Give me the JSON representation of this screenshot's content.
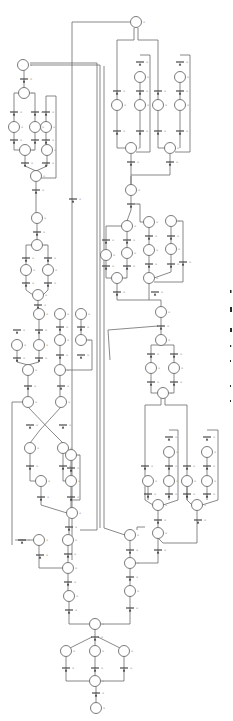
{
  "figure": {
    "kind": "petri-net",
    "colors": {
      "stroke": "#6b6b6b",
      "transition": "#3a3a3a",
      "label": "#9a9a9a",
      "background": "#ffffff"
    },
    "place_radius": 5.5,
    "places": [
      {
        "id": "p_top",
        "x": 136,
        "y": 22
      },
      {
        "id": "p_l1",
        "x": 23,
        "y": 65
      },
      {
        "id": "p_l2",
        "x": 24,
        "y": 93
      },
      {
        "id": "p_r1",
        "x": 140,
        "y": 77
      },
      {
        "id": "p_r2",
        "x": 180,
        "y": 77
      },
      {
        "id": "p_r3",
        "x": 117,
        "y": 105
      },
      {
        "id": "p_r4",
        "x": 140,
        "y": 105
      },
      {
        "id": "p_r5",
        "x": 158,
        "y": 105
      },
      {
        "id": "p_r6",
        "x": 180,
        "y": 105
      },
      {
        "id": "p_r7",
        "x": 131,
        "y": 148
      },
      {
        "id": "p_r8",
        "x": 170,
        "y": 148
      },
      {
        "id": "p_l3",
        "x": 14,
        "y": 127
      },
      {
        "id": "p_l4",
        "x": 35,
        "y": 127
      },
      {
        "id": "p_l5",
        "x": 46,
        "y": 127
      },
      {
        "id": "p_l6",
        "x": 25,
        "y": 150
      },
      {
        "id": "p_l7",
        "x": 47,
        "y": 150
      },
      {
        "id": "p_l8",
        "x": 36,
        "y": 176
      },
      {
        "id": "p_l9",
        "x": 37,
        "y": 218
      },
      {
        "id": "p_l10",
        "x": 37,
        "y": 245
      },
      {
        "id": "p_l11",
        "x": 26,
        "y": 270
      },
      {
        "id": "p_l12",
        "x": 48,
        "y": 270
      },
      {
        "id": "p_l13",
        "x": 38,
        "y": 295
      },
      {
        "id": "p_m1",
        "x": 131,
        "y": 190
      },
      {
        "id": "p_m2",
        "x": 127,
        "y": 226
      },
      {
        "id": "p_m3",
        "x": 149,
        "y": 222
      },
      {
        "id": "p_m4",
        "x": 171,
        "y": 221
      },
      {
        "id": "p_m5",
        "x": 106,
        "y": 255
      },
      {
        "id": "p_m6",
        "x": 127,
        "y": 253
      },
      {
        "id": "p_m7",
        "x": 149,
        "y": 250
      },
      {
        "id": "p_m8",
        "x": 171,
        "y": 249
      },
      {
        "id": "p_m9",
        "x": 117,
        "y": 278
      },
      {
        "id": "p_m10",
        "x": 149,
        "y": 278
      },
      {
        "id": "p_m11",
        "x": 161,
        "y": 312
      },
      {
        "id": "p_c1",
        "x": 39,
        "y": 314
      },
      {
        "id": "p_c2",
        "x": 60,
        "y": 314
      },
      {
        "id": "p_c3",
        "x": 81,
        "y": 314
      },
      {
        "id": "p_c4",
        "x": 17,
        "y": 345
      },
      {
        "id": "p_c5",
        "x": 39,
        "y": 345
      },
      {
        "id": "p_c6",
        "x": 60,
        "y": 340
      },
      {
        "id": "p_c7",
        "x": 81,
        "y": 340
      },
      {
        "id": "p_c8",
        "x": 28,
        "y": 370
      },
      {
        "id": "p_c9",
        "x": 60,
        "y": 370
      },
      {
        "id": "p_c10",
        "x": 28,
        "y": 402
      },
      {
        "id": "p_c11",
        "x": 61,
        "y": 402
      },
      {
        "id": "p_c12",
        "x": 30,
        "y": 448
      },
      {
        "id": "p_c13",
        "x": 63,
        "y": 448
      },
      {
        "id": "p_c14",
        "x": 71,
        "y": 455
      },
      {
        "id": "p_c15",
        "x": 41,
        "y": 481
      },
      {
        "id": "p_c16",
        "x": 71,
        "y": 481
      },
      {
        "id": "p_c17",
        "x": 72,
        "y": 513
      },
      {
        "id": "p_s1",
        "x": 161,
        "y": 340
      },
      {
        "id": "p_s2",
        "x": 151,
        "y": 368
      },
      {
        "id": "p_s3",
        "x": 174,
        "y": 368
      },
      {
        "id": "p_s4",
        "x": 163,
        "y": 393
      },
      {
        "id": "p_s5",
        "x": 169,
        "y": 452
      },
      {
        "id": "p_s6",
        "x": 207,
        "y": 452
      },
      {
        "id": "p_s7",
        "x": 148,
        "y": 481
      },
      {
        "id": "p_s8",
        "x": 169,
        "y": 481
      },
      {
        "id": "p_s9",
        "x": 187,
        "y": 481
      },
      {
        "id": "p_s10",
        "x": 207,
        "y": 481
      },
      {
        "id": "p_s11",
        "x": 158,
        "y": 505
      },
      {
        "id": "p_s12",
        "x": 197,
        "y": 505
      },
      {
        "id": "p_b1",
        "x": 39,
        "y": 540
      },
      {
        "id": "p_b2",
        "x": 68,
        "y": 540
      },
      {
        "id": "p_b3",
        "x": 68,
        "y": 568
      },
      {
        "id": "p_b4",
        "x": 69,
        "y": 596
      },
      {
        "id": "p_b5",
        "x": 130,
        "y": 535
      },
      {
        "id": "p_b6",
        "x": 158,
        "y": 533
      },
      {
        "id": "p_b7",
        "x": 130,
        "y": 563
      },
      {
        "id": "p_b8",
        "x": 130,
        "y": 591
      },
      {
        "id": "p_b9",
        "x": 95,
        "y": 624
      },
      {
        "id": "p_b10",
        "x": 66,
        "y": 651
      },
      {
        "id": "p_b11",
        "x": 95,
        "y": 651
      },
      {
        "id": "p_b12",
        "x": 124,
        "y": 651
      },
      {
        "id": "p_b13",
        "x": 95,
        "y": 681
      },
      {
        "id": "p_b14",
        "x": 96,
        "y": 708
      }
    ],
    "transitions": [
      {
        "x": 24,
        "y": 79
      },
      {
        "x": 14,
        "y": 112
      },
      {
        "x": 35,
        "y": 112
      },
      {
        "x": 46,
        "y": 112
      },
      {
        "x": 14,
        "y": 140
      },
      {
        "x": 35,
        "y": 140
      },
      {
        "x": 46,
        "y": 140
      },
      {
        "x": 46,
        "y": 163
      },
      {
        "x": 25,
        "y": 163
      },
      {
        "x": 36,
        "y": 190
      },
      {
        "x": 37,
        "y": 232
      },
      {
        "x": 26,
        "y": 258
      },
      {
        "x": 48,
        "y": 258
      },
      {
        "x": 26,
        "y": 283
      },
      {
        "x": 48,
        "y": 283
      },
      {
        "x": 38,
        "y": 305
      },
      {
        "x": 117,
        "y": 91
      },
      {
        "x": 140,
        "y": 62
      },
      {
        "x": 140,
        "y": 91
      },
      {
        "x": 158,
        "y": 91
      },
      {
        "x": 180,
        "y": 62
      },
      {
        "x": 180,
        "y": 91
      },
      {
        "x": 117,
        "y": 131
      },
      {
        "x": 140,
        "y": 131
      },
      {
        "x": 158,
        "y": 131
      },
      {
        "x": 180,
        "y": 131
      },
      {
        "x": 131,
        "y": 162
      },
      {
        "x": 170,
        "y": 162
      },
      {
        "x": 73,
        "y": 199
      },
      {
        "x": 131,
        "y": 204
      },
      {
        "x": 106,
        "y": 240
      },
      {
        "x": 127,
        "y": 240
      },
      {
        "x": 149,
        "y": 236
      },
      {
        "x": 171,
        "y": 236
      },
      {
        "x": 106,
        "y": 266
      },
      {
        "x": 127,
        "y": 266
      },
      {
        "x": 149,
        "y": 264
      },
      {
        "x": 171,
        "y": 264
      },
      {
        "x": 183,
        "y": 262
      },
      {
        "x": 117,
        "y": 292
      },
      {
        "x": 155,
        "y": 292
      },
      {
        "x": 161,
        "y": 326
      },
      {
        "x": 17,
        "y": 330
      },
      {
        "x": 39,
        "y": 330
      },
      {
        "x": 60,
        "y": 327
      },
      {
        "x": 81,
        "y": 327
      },
      {
        "x": 17,
        "y": 358
      },
      {
        "x": 39,
        "y": 358
      },
      {
        "x": 60,
        "y": 355
      },
      {
        "x": 81,
        "y": 355
      },
      {
        "x": 28,
        "y": 386
      },
      {
        "x": 61,
        "y": 386
      },
      {
        "x": 30,
        "y": 425
      },
      {
        "x": 63,
        "y": 425
      },
      {
        "x": 30,
        "y": 466
      },
      {
        "x": 63,
        "y": 466
      },
      {
        "x": 71,
        "y": 468
      },
      {
        "x": 41,
        "y": 497
      },
      {
        "x": 71,
        "y": 497
      },
      {
        "x": 151,
        "y": 354
      },
      {
        "x": 174,
        "y": 354
      },
      {
        "x": 151,
        "y": 382
      },
      {
        "x": 174,
        "y": 382
      },
      {
        "x": 145,
        "y": 466
      },
      {
        "x": 169,
        "y": 437
      },
      {
        "x": 169,
        "y": 466
      },
      {
        "x": 187,
        "y": 466
      },
      {
        "x": 207,
        "y": 437
      },
      {
        "x": 207,
        "y": 466
      },
      {
        "x": 148,
        "y": 494
      },
      {
        "x": 169,
        "y": 494
      },
      {
        "x": 187,
        "y": 494
      },
      {
        "x": 207,
        "y": 494
      },
      {
        "x": 158,
        "y": 520
      },
      {
        "x": 198,
        "y": 520
      },
      {
        "x": 69,
        "y": 527
      },
      {
        "x": 40,
        "y": 555
      },
      {
        "x": 68,
        "y": 554
      },
      {
        "x": 68,
        "y": 582
      },
      {
        "x": 69,
        "y": 610
      },
      {
        "x": 130,
        "y": 550
      },
      {
        "x": 158,
        "y": 550
      },
      {
        "x": 130,
        "y": 577
      },
      {
        "x": 130,
        "y": 608
      },
      {
        "x": 95,
        "y": 637
      },
      {
        "x": 66,
        "y": 668
      },
      {
        "x": 95,
        "y": 668
      },
      {
        "x": 124,
        "y": 668
      },
      {
        "x": 96,
        "y": 693
      },
      {
        "x": 22,
        "y": 540
      }
    ],
    "caption_marks": [
      {
        "x": 230,
        "y": 290,
        "w": 1.5,
        "h": 3
      },
      {
        "x": 230,
        "y": 307,
        "w": 2,
        "h": 5
      },
      {
        "x": 230,
        "y": 328,
        "w": 2,
        "h": 4
      },
      {
        "x": 230,
        "y": 345,
        "w": 1.2,
        "h": 2
      },
      {
        "x": 230,
        "y": 360,
        "w": 1,
        "h": 2
      },
      {
        "x": 230,
        "y": 385,
        "w": 1,
        "h": 2
      },
      {
        "x": 230,
        "y": 400,
        "w": 1,
        "h": 2
      }
    ]
  }
}
